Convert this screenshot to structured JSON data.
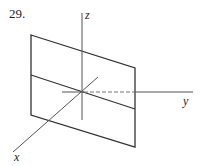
{
  "problem_number": "29.",
  "axes": {
    "x_label": "x",
    "y_label": "y",
    "z_label": "z"
  },
  "colors": {
    "line": "#333333",
    "axis": "#555555"
  }
}
